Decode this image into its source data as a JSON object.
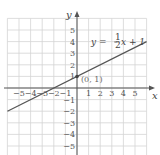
{
  "chart_data": {
    "type": "line",
    "title": "",
    "xlabel": "x",
    "ylabel": "y",
    "xlim": [
      -6,
      6
    ],
    "ylim": [
      -6,
      6
    ],
    "grid": true,
    "x_ticks": [
      "−5",
      "−4",
      "−3",
      "−2",
      "−1",
      "1",
      "2",
      "3",
      "4",
      "5"
    ],
    "y_ticks": [
      "5",
      "4",
      "3",
      "2",
      "1",
      "−1",
      "−2",
      "−3",
      "−4",
      "−5"
    ],
    "series": [
      {
        "name": "y = 1/2 x + 1",
        "slope": 0.5,
        "intercept": 1,
        "x": [
          -6,
          6
        ],
        "y": [
          -2,
          4
        ],
        "color": "#555555"
      }
    ],
    "annotations": [
      {
        "text": "y = ½x + 1",
        "position": "upper right"
      },
      {
        "text": "(0, 1)",
        "point": [
          0,
          1
        ]
      }
    ]
  },
  "labels": {
    "x_axis": "x",
    "y_axis": "y",
    "equation": "y = ",
    "frac_num": "1",
    "frac_den": "2",
    "equation_tail": "x + 1",
    "point": "(0, 1)"
  }
}
